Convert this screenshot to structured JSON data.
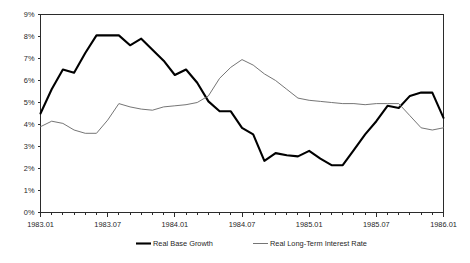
{
  "chart_data": {
    "type": "line",
    "title": "",
    "xlabel": "",
    "ylabel": "",
    "ylim": [
      0,
      9
    ],
    "ytick_labels": [
      "0%",
      "1%",
      "2%",
      "3%",
      "4%",
      "5%",
      "6%",
      "7%",
      "8%",
      "9%"
    ],
    "ytick_values": [
      0,
      1,
      2,
      3,
      4,
      5,
      6,
      7,
      8,
      9
    ],
    "grid": false,
    "legend_position": "bottom",
    "x": [
      "1983.01",
      "1983.02",
      "1983.03",
      "1983.04",
      "1983.05",
      "1983.06",
      "1983.07",
      "1983.08",
      "1983.09",
      "1983.10",
      "1983.11",
      "1983.12",
      "1984.01",
      "1984.02",
      "1984.03",
      "1984.04",
      "1984.05",
      "1984.06",
      "1984.07",
      "1984.08",
      "1984.09",
      "1984.10",
      "1984.11",
      "1984.12",
      "1985.01",
      "1985.02",
      "1985.03",
      "1985.04",
      "1985.05",
      "1985.06",
      "1985.07",
      "1985.08",
      "1985.09",
      "1985.10",
      "1985.11",
      "1985.12",
      "1986.01"
    ],
    "xtick_labels": [
      "1983.01",
      "1983.07",
      "1984.01",
      "1984.07",
      "1985.01",
      "1985.07",
      "1986.01"
    ],
    "xtick_indices": [
      0,
      6,
      12,
      18,
      24,
      30,
      36
    ],
    "series": [
      {
        "name": "Real Base Growth",
        "color": "#000000",
        "width": "thick",
        "values": [
          4.5,
          5.6,
          6.5,
          6.35,
          7.25,
          8.05,
          8.05,
          8.05,
          7.6,
          7.9,
          7.4,
          6.9,
          6.25,
          6.5,
          5.9,
          5.05,
          4.6,
          4.6,
          3.85,
          3.55,
          2.35,
          2.7,
          2.6,
          2.55,
          2.8,
          2.45,
          2.15,
          2.15,
          2.85,
          3.55,
          4.15,
          4.85,
          4.75,
          5.3,
          5.45,
          5.45,
          4.3
        ]
      },
      {
        "name": "Real Long-Term Interest Rate",
        "color": "#6e6e6e",
        "width": "thin",
        "values": [
          3.9,
          4.15,
          4.05,
          3.75,
          3.6,
          3.6,
          4.2,
          4.95,
          4.8,
          4.7,
          4.65,
          4.8,
          4.85,
          4.9,
          5.0,
          5.3,
          6.1,
          6.6,
          6.95,
          6.7,
          6.3,
          6.0,
          5.6,
          5.2,
          5.1,
          5.05,
          5.0,
          4.95,
          4.95,
          4.9,
          4.95,
          4.95,
          4.95,
          4.4,
          3.85,
          3.75,
          3.85
        ]
      }
    ]
  },
  "legend": {
    "entries": [
      {
        "label": "Real Base Growth"
      },
      {
        "label": "Real Long-Term Interest Rate"
      }
    ]
  }
}
